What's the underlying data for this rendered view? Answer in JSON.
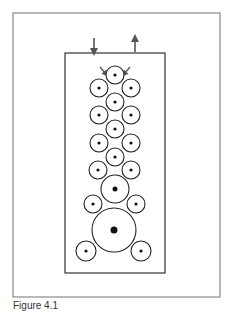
{
  "figure": {
    "caption": "Figure 4.1",
    "colors": {
      "outer_frame": "#8a8a8a",
      "inner_frame": "#333333",
      "roller": "#222222",
      "arrow": "#555555"
    },
    "outer_frame": {
      "x": 13,
      "y": 13,
      "w": 207,
      "h": 284
    },
    "inner_frame": {
      "x": 65,
      "y": 53,
      "w": 100,
      "h": 220
    },
    "feed_arrows": [
      {
        "name": "inlet",
        "direction": "down",
        "x": 94,
        "y1": 38,
        "y2": 52
      },
      {
        "name": "outlet",
        "direction": "up",
        "x": 135,
        "y1": 52,
        "y2": 38
      }
    ],
    "rollers": [
      {
        "cx": 115,
        "cy": 75,
        "r": 9
      },
      {
        "cx": 99,
        "cy": 88,
        "r": 9
      },
      {
        "cx": 131,
        "cy": 88,
        "r": 9
      },
      {
        "cx": 115,
        "cy": 102,
        "r": 9
      },
      {
        "cx": 99,
        "cy": 115,
        "r": 9
      },
      {
        "cx": 131,
        "cy": 115,
        "r": 9
      },
      {
        "cx": 115,
        "cy": 129,
        "r": 9
      },
      {
        "cx": 99,
        "cy": 143,
        "r": 9
      },
      {
        "cx": 131,
        "cy": 143,
        "r": 9
      },
      {
        "cx": 115,
        "cy": 157,
        "r": 9
      },
      {
        "cx": 98,
        "cy": 170,
        "r": 9
      },
      {
        "cx": 131,
        "cy": 170,
        "r": 9
      },
      {
        "cx": 115,
        "cy": 189,
        "r": 14
      },
      {
        "cx": 93,
        "cy": 204,
        "r": 9
      },
      {
        "cx": 136,
        "cy": 204,
        "r": 9
      },
      {
        "cx": 114,
        "cy": 230,
        "r": 22
      },
      {
        "cx": 86,
        "cy": 251,
        "r": 10
      },
      {
        "cx": 141,
        "cy": 251,
        "r": 10
      }
    ]
  }
}
